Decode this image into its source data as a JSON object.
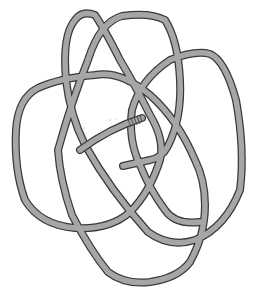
{
  "figure": {
    "type": "knot-diagram",
    "description": "Single rope tied into a complex interlaced knot with one whipped end",
    "colors": {
      "background": "#ffffff",
      "rope_fill": "#a6a6a6",
      "rope_outline": "#3a3a3a",
      "whipping": "#4a4a4a"
    },
    "rope": {
      "ends": [
        {
          "name": "whipped-end",
          "position": [
            142,
            118
          ],
          "style": "whipped"
        },
        {
          "name": "plain-end",
          "position": [
            123,
            166
          ],
          "style": "plain"
        }
      ]
    },
    "caption": ""
  }
}
